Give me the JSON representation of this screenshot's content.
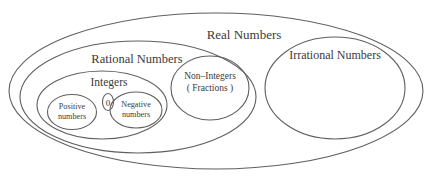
{
  "diagram": {
    "colors": {
      "background": "#ffffff",
      "stroke": "#5f5f5f",
      "text": "#3a3a3a"
    },
    "sets": {
      "real": {
        "label": "Real Numbers"
      },
      "rational": {
        "label": "Rational Numbers"
      },
      "integers": {
        "label": "Integers"
      },
      "positive": {
        "line1": "Positive",
        "line2": "numbers"
      },
      "zero": {
        "label": "0"
      },
      "negative": {
        "line1": "Negative",
        "line2": "numbers"
      },
      "non_integers": {
        "line1": "Non–Integers",
        "line2": "( Fractions )"
      },
      "irrational": {
        "label": "Irrational Numbers"
      }
    }
  }
}
